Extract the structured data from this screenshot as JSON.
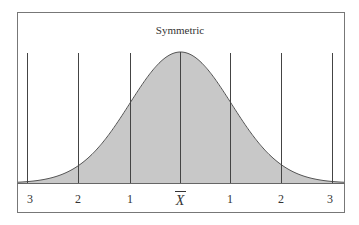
{
  "chart_data": {
    "type": "area",
    "title": "Symmetric",
    "xlabel": "",
    "ylabel": "",
    "x_ticks": [
      "3",
      "2",
      "1",
      "X̄",
      "1",
      "2",
      "3"
    ],
    "x_positions_sd": [
      -3,
      -2,
      -1,
      0,
      1,
      2,
      3
    ],
    "xlim_sd": [
      -3.2,
      3.25
    ],
    "grid": false,
    "legend": null,
    "series": [
      {
        "name": "normal density",
        "x": [
          -3.2,
          -3,
          -2.5,
          -2,
          -1.5,
          -1,
          -0.5,
          0,
          0.5,
          1,
          1.5,
          2,
          2.5,
          3,
          3.25
        ],
        "values": [
          0.0024,
          0.0044,
          0.0175,
          0.054,
          0.1295,
          0.242,
          0.352,
          0.399,
          0.352,
          0.242,
          0.1295,
          0.054,
          0.0175,
          0.0044,
          0.002
        ]
      }
    ],
    "colors": {
      "fill": "#c8c8c8",
      "curve": "#555555",
      "lines": "#444444",
      "frame": "#777777"
    }
  },
  "title": "Symmetric",
  "axis_labels": {
    "l3": "3",
    "l2": "2",
    "l1": "1",
    "mean": "X",
    "r1": "1",
    "r2": "2",
    "r3": "3"
  }
}
